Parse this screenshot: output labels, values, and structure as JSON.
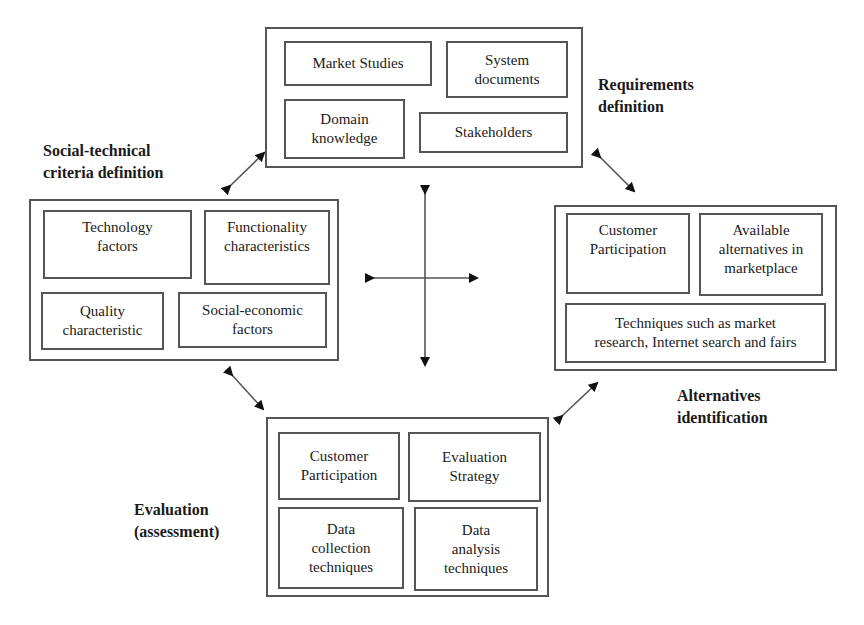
{
  "diagram": {
    "type": "cyclic process diagram",
    "center_symbol": "four-way-arrow",
    "stages": [
      {
        "id": "requirements",
        "title": "Requirements\ndefinition",
        "items": [
          "Market Studies",
          "System\ndocuments",
          "Domain\nknowledge",
          "Stakeholders"
        ]
      },
      {
        "id": "social_technical",
        "title": "Social-technical\ncriteria definition",
        "items": [
          "Technology\nfactors",
          "Functionality\ncharacteristics",
          "Quality\ncharacteristic",
          "Social-economic\nfactors"
        ]
      },
      {
        "id": "alternatives",
        "title": "Alternatives\nidentification",
        "items": [
          "Customer\nParticipation",
          "Available\nalternatives in\nmarketplace",
          "Techniques such as market\nresearch, Internet search and fairs"
        ]
      },
      {
        "id": "evaluation",
        "title": "Evaluation\n(assessment)",
        "items": [
          "Customer\nParticipation",
          "Evaluation\nStrategy",
          "Data\ncollection\ntechniques",
          "Data\nanalysis\ntechniques"
        ]
      }
    ],
    "connections": [
      {
        "from": "social_technical",
        "to": "requirements",
        "style": "bidirectional"
      },
      {
        "from": "requirements",
        "to": "alternatives",
        "style": "bidirectional"
      },
      {
        "from": "alternatives",
        "to": "evaluation",
        "style": "bidirectional"
      },
      {
        "from": "evaluation",
        "to": "social_technical",
        "style": "bidirectional"
      }
    ],
    "colors": {
      "line": "#555555",
      "text": "#1a1a1a",
      "background": "#ffffff"
    }
  }
}
